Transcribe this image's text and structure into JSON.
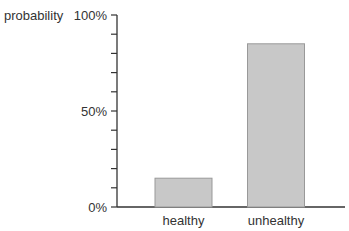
{
  "chart_data": {
    "type": "bar",
    "title": "",
    "xlabel": "",
    "ylabel": "probability",
    "categories": [
      "healthy",
      "unhealthy"
    ],
    "values": [
      15,
      85
    ],
    "ylim": [
      0,
      100
    ],
    "yticks": [
      0,
      10,
      20,
      30,
      40,
      50,
      60,
      70,
      80,
      90,
      100
    ],
    "ytick_labels": {
      "0": "0%",
      "50": "50%",
      "100": "100%"
    },
    "grid": false,
    "legend": null,
    "bar_color": "#c8c8c8",
    "bar_edge_color": "#999999"
  }
}
